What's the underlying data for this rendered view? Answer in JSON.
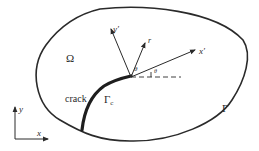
{
  "diagram": {
    "domain_label": "Ω",
    "boundary_label": "Γ",
    "crack_label": "crack",
    "crack_face_label": "Γ",
    "crack_face_subscript": "c",
    "global_axes": {
      "x": "x",
      "y": "y"
    },
    "local_axes": {
      "x": "x′",
      "y": "y′"
    },
    "polar_radius": "r",
    "polar_angle": "θ",
    "orientation_angle": "θ",
    "orientation_angle_subscript": "",
    "colors": {
      "stroke": "#2a2a2a",
      "background": "#ffffff"
    }
  }
}
